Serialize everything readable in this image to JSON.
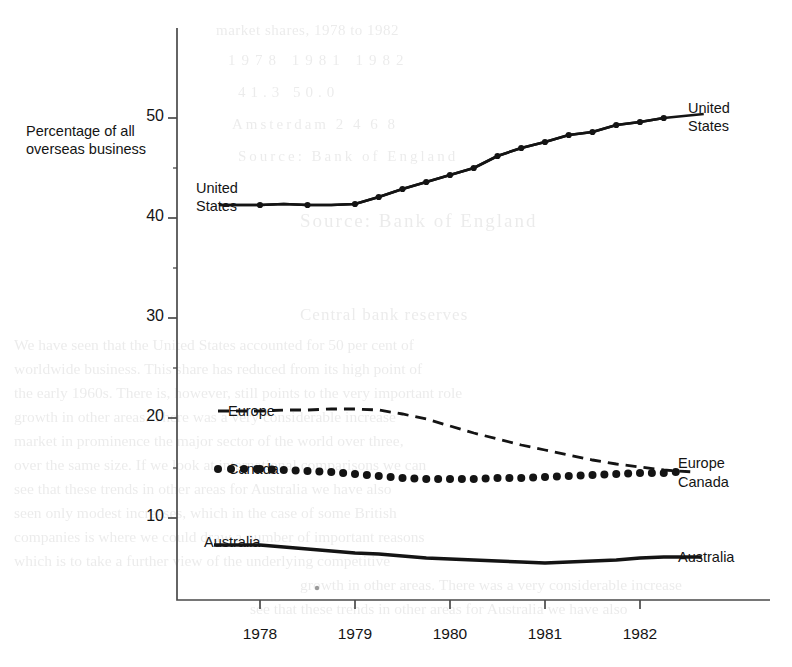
{
  "chart_data": {
    "type": "line",
    "title": "",
    "ylabel_line1": "Percentage of all",
    "ylabel_line2": "overseas business",
    "xlabel": "",
    "ylim": [
      0,
      55
    ],
    "yticks": [
      10,
      20,
      30,
      40,
      50
    ],
    "xlim": [
      1977.75,
      1982.6
    ],
    "xticks": [
      "1978",
      "1979",
      "1980",
      "1981",
      "1982"
    ],
    "grid": false,
    "legend_position": "inline-end-of-series",
    "x_quarterly": [
      1978.0,
      1978.25,
      1978.5,
      1978.75,
      1979.0,
      1979.25,
      1979.5,
      1979.75,
      1980.0,
      1980.25,
      1980.5,
      1980.75,
      1981.0,
      1981.25,
      1981.5,
      1981.75,
      1982.0,
      1982.25
    ],
    "series": [
      {
        "name": "United States",
        "style": "line-with-markers",
        "label_left": "United\nStates",
        "label_right": "United\nStates",
        "values": [
          41.3,
          41.4,
          41.3,
          41.3,
          41.4,
          42.1,
          42.9,
          43.6,
          44.3,
          45.0,
          46.2,
          47.0,
          47.6,
          48.3,
          48.6,
          49.3,
          49.6,
          50.0
        ]
      },
      {
        "name": "Europe",
        "style": "dashed",
        "label_left": "Europe",
        "label_right": "Europe",
        "values": [
          20.7,
          20.8,
          20.8,
          20.9,
          20.9,
          20.8,
          20.4,
          19.9,
          19.2,
          18.5,
          17.9,
          17.3,
          16.8,
          16.3,
          15.8,
          15.4,
          15.1,
          14.8
        ]
      },
      {
        "name": "Canada",
        "style": "dotted-markers",
        "label_left": "Canada",
        "label_right": "Canada",
        "values": [
          14.9,
          14.8,
          14.7,
          14.6,
          14.4,
          14.2,
          14.0,
          13.9,
          13.9,
          13.9,
          14.0,
          14.0,
          14.1,
          14.2,
          14.3,
          14.4,
          14.5,
          14.5
        ]
      },
      {
        "name": "Australia",
        "style": "solid-thick",
        "label_left": "Australia",
        "label_right": "Australia",
        "values": [
          7.3,
          7.1,
          6.9,
          6.7,
          6.5,
          6.4,
          6.2,
          6.0,
          5.9,
          5.8,
          5.7,
          5.6,
          5.5,
          5.6,
          5.7,
          5.8,
          6.0,
          6.1
        ]
      }
    ]
  },
  "labels": {
    "y_axis_line1": "Percentage of all",
    "y_axis_line2": "overseas business",
    "us_left_line1": "United",
    "us_left_line2": "States",
    "us_right_line1": "United",
    "us_right_line2": "States",
    "europe_left": "Europe",
    "canada_left": "Canada",
    "australia_left": "Australia",
    "europe_right": "Europe",
    "canada_right": "Canada",
    "australia_right": "Australia",
    "ytick_50": "50",
    "ytick_40": "40",
    "ytick_30": "30",
    "ytick_20": "20",
    "ytick_10": "10",
    "xtick_1978": "1978",
    "xtick_1979": "1979",
    "xtick_1980": "1980",
    "xtick_1981": "1981",
    "xtick_1982": "1982"
  },
  "ghost_text": {
    "rows": [
      "market shares, 1978 to 1982",
      "1978      1981      1982",
      "41.3                  50.0",
      "Amsterdam  2   4   6   8",
      "Source: Bank of England",
      "Central bank reserves",
      "We have seen that the United States accounted for 50 per cent of",
      "worldwide business. This share has reduced from its high point of",
      "the early 1960s. There is, however, still points to the very important role",
      "growth in other areas. There was a very considerable increase",
      "market in prominence the major sector of the world over three,",
      "over the same size. If we look at international comparisons we can",
      "see that these trends in other areas for Australia we have also",
      "seen only modest increases, which in the case of some British",
      "companies is where we could draw a number of important reasons",
      "which is to take a further view of the underlying competitive"
    ]
  },
  "colors": {
    "ink": "#141414",
    "axis": "#4a4a4a",
    "paper": "#ffffff",
    "ghost": "#8d8d8d"
  }
}
